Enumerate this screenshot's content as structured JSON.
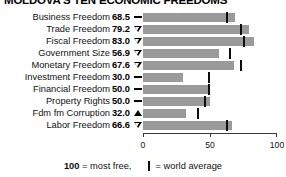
{
  "title": "MOLDOVA'S TEN ECONOMIC FREEDOMS",
  "footer": {
    "most_free_value": "100",
    "most_free_text": "= most free,",
    "world_average_text": "= world average",
    "legend_mark_name": "world-average-mark"
  },
  "axis": {
    "ticks": [
      "0",
      "50",
      "100"
    ],
    "min": 0,
    "max": 100
  },
  "colors": {
    "bar": "#9a9a9a",
    "marker": "#0d0d0d",
    "text": "#111111",
    "axis": "#3a3a3a"
  },
  "chart_data": {
    "type": "bar",
    "title": "MOLDOVA'S TEN ECONOMIC FREEDOMS",
    "xlabel": "",
    "ylabel": "",
    "xlim": [
      0,
      100
    ],
    "grid": false,
    "orientation": "horizontal",
    "legend": "100 = most free, | = world average",
    "categories": [
      "Business Freedom",
      "Trade Freedom",
      "Fiscal Freedom",
      "Government Size",
      "Monetary Freedom",
      "Investment Freedom",
      "Financial Freedom",
      "Property Rights",
      "Fdm fm Corruption",
      "Labor Freedom"
    ],
    "values": [
      68.5,
      79.2,
      83.0,
      56.9,
      67.6,
      30.0,
      50.0,
      50.0,
      32.0,
      66.6
    ],
    "world_average": [
      63.0,
      73.0,
      75.5,
      65.0,
      73.5,
      49.5,
      49.0,
      46.0,
      41.0,
      62.5
    ],
    "trends": [
      "flat",
      "down",
      "down",
      "down",
      "down",
      "flat",
      "flat",
      "flat",
      "up",
      "down"
    ]
  },
  "rows": [
    {
      "label": "Business Freedom",
      "value": "68.5",
      "trend": "flat",
      "trend_name": "trend-flat-icon"
    },
    {
      "label": "Trade Freedom",
      "value": "79.2",
      "trend": "down",
      "trend_name": "trend-down-icon"
    },
    {
      "label": "Fiscal Freedom",
      "value": "83.0",
      "trend": "down",
      "trend_name": "trend-down-icon"
    },
    {
      "label": "Government Size",
      "value": "56.9",
      "trend": "down",
      "trend_name": "trend-down-icon"
    },
    {
      "label": "Monetary Freedom",
      "value": "67.6",
      "trend": "down",
      "trend_name": "trend-down-icon"
    },
    {
      "label": "Investment Freedom",
      "value": "30.0",
      "trend": "flat",
      "trend_name": "trend-flat-icon"
    },
    {
      "label": "Financial Freedom",
      "value": "50.0",
      "trend": "flat",
      "trend_name": "trend-flat-icon"
    },
    {
      "label": "Property Rights",
      "value": "50.0",
      "trend": "flat",
      "trend_name": "trend-flat-icon"
    },
    {
      "label": "Fdm fm Corruption",
      "value": "32.0",
      "trend": "up",
      "trend_name": "trend-up-icon"
    },
    {
      "label": "Labor Freedom",
      "value": "66.6",
      "trend": "down",
      "trend_name": "trend-down-icon"
    }
  ]
}
